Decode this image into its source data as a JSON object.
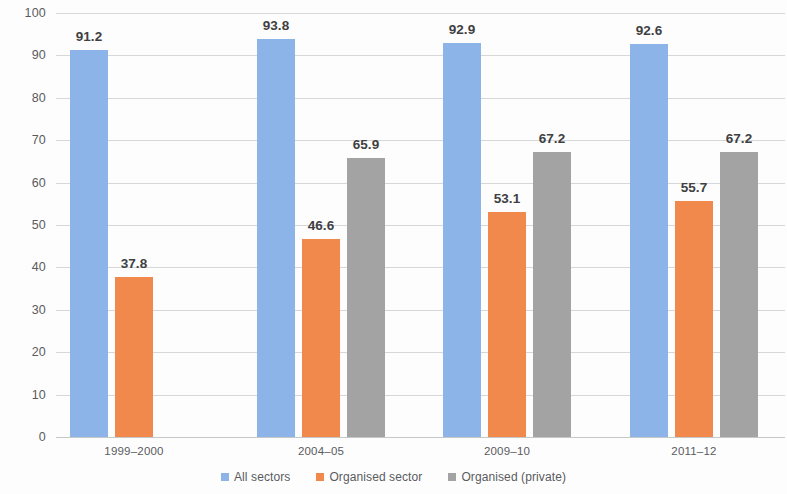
{
  "chart_data": {
    "type": "bar",
    "title": "",
    "subtitle": "",
    "xlabel": "",
    "ylabel": "",
    "ylim": [
      0,
      100
    ],
    "ytick_step": 10,
    "yticks": [
      "100",
      "90",
      "80",
      "70",
      "60",
      "50",
      "40",
      "30",
      "20",
      "10",
      "0"
    ],
    "grid": true,
    "legend_position": "bottom",
    "categories": [
      "1999–2000",
      "2004–05",
      "2009–10",
      "2011–12"
    ],
    "series": [
      {
        "name": "All sectors",
        "color": "#8cb4e8",
        "values": [
          91.2,
          93.8,
          92.9,
          92.6
        ],
        "labels": [
          "91.2",
          "93.8",
          "92.9",
          "92.6"
        ]
      },
      {
        "name": "Organised sector",
        "color": "#f0894b",
        "values": [
          37.8,
          46.6,
          53.1,
          55.7
        ],
        "labels": [
          "37.8",
          "46.6",
          "53.1",
          "55.7"
        ]
      },
      {
        "name": "Organised (private)",
        "color": "#a3a3a3",
        "values": [
          null,
          65.9,
          67.2,
          67.2
        ],
        "labels": [
          "",
          "65.9",
          "67.2",
          "67.2"
        ]
      }
    ]
  },
  "colors": {
    "series_0": "#8cb4e8",
    "series_1": "#f0894b",
    "series_2": "#a3a3a3",
    "gridline": "#d6d7d8",
    "text": "#5a5b5d",
    "value_text": "#3f4042",
    "background": "#fdfdfd"
  }
}
